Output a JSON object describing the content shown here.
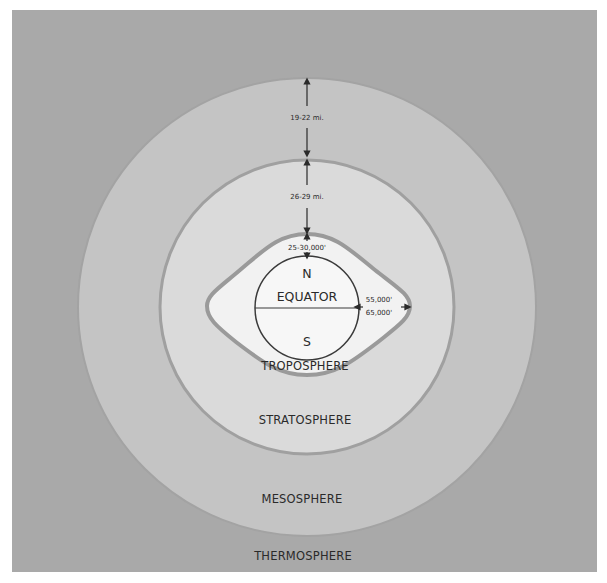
{
  "diagram": {
    "colors": {
      "background": "#ffffff",
      "thermosphere_fill": "#a9a9a9",
      "mesosphere_fill": "#c4c4c4",
      "stratosphere_fill": "#dadada",
      "troposphere_fill": "#f2f2f2",
      "boundary_stroke": "#9a9a9a",
      "text": "#2a2a2a"
    },
    "layers": [
      {
        "id": "thermosphere",
        "label": "THERMOSPHERE"
      },
      {
        "id": "mesosphere",
        "label": "MESOSPHERE"
      },
      {
        "id": "stratosphere",
        "label": "STRATOSPHERE"
      },
      {
        "id": "troposphere",
        "label": "TROPOSPHERE"
      }
    ],
    "measurements": {
      "mesosphere_thickness": "19-22 mi.",
      "stratosphere_thickness": "26-29 mi.",
      "troposphere_polar_height": "25-30,000'",
      "troposphere_equatorial_height_line1": "55,000'",
      "troposphere_equatorial_height_line2": "65,000'"
    },
    "globe": {
      "north_label": "N",
      "equator_label": "EQUATOR",
      "south_label": "S"
    }
  }
}
